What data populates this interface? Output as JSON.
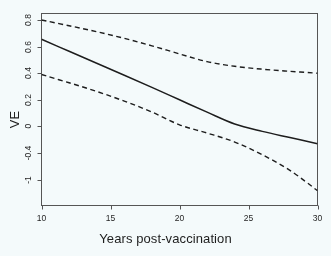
{
  "figure": {
    "background_color": "#f4fafb",
    "page_tint": "#eef6f8",
    "line_color": "#1d1d1d",
    "frame_color": "#555555"
  },
  "chart_data": {
    "type": "line",
    "title": "",
    "xlabel": "Years post-vaccination",
    "ylabel": "VE",
    "xlim": [
      10,
      30
    ],
    "ylim": [
      -1.35,
      0.88
    ],
    "grid": false,
    "legend": null,
    "xticks": [
      10,
      15,
      20,
      25,
      30
    ],
    "xtick_labels": [
      "10",
      "15",
      "20",
      "25",
      "30"
    ],
    "yticks": [
      0.8,
      0.6,
      0.4,
      0.2,
      0,
      -0.4,
      -1
    ],
    "ytick_labels": [
      "0.8",
      "0.6",
      "0.4",
      "0.2",
      "0",
      "-0.4",
      "-1"
    ],
    "series": [
      {
        "name": "Vaccine effectiveness (point estimate)",
        "style": "solid",
        "x": [
          10,
          12,
          14,
          16,
          18,
          20,
          22,
          24,
          26,
          28,
          30
        ],
        "values": [
          0.655,
          0.565,
          0.475,
          0.385,
          0.293,
          0.2,
          0.107,
          0.018,
          -0.075,
          -0.168,
          -0.26
        ]
      },
      {
        "name": "Upper 95% confidence limit",
        "style": "dashed",
        "x": [
          10,
          12,
          14,
          16,
          18,
          20,
          22,
          24,
          26,
          28,
          30
        ],
        "values": [
          0.8,
          0.757,
          0.712,
          0.662,
          0.606,
          0.545,
          0.487,
          0.452,
          0.43,
          0.414,
          0.4
        ]
      },
      {
        "name": "Lower 95% confidence limit",
        "style": "dashed",
        "x": [
          10,
          12,
          14,
          16,
          18,
          20,
          22,
          24,
          26,
          28,
          30
        ],
        "values": [
          0.39,
          0.328,
          0.263,
          0.19,
          0.108,
          0.012,
          -0.1,
          -0.235,
          -0.44,
          -0.79,
          -1.25
        ]
      }
    ]
  }
}
